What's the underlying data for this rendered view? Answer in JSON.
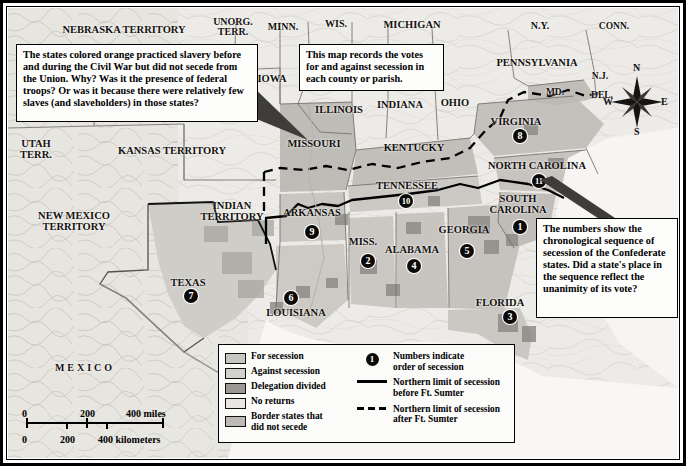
{
  "map": {
    "title_hidden": "Secession of the Southern States",
    "state_labels": [
      {
        "text": "NEBRASKA TERRITORY",
        "x": 124,
        "y": 30,
        "size": 10.5,
        "spaced": false
      },
      {
        "text": "UNORG.\nTERR.",
        "x": 233,
        "y": 27,
        "size": 10,
        "spaced": false
      },
      {
        "text": "MINN.",
        "x": 283,
        "y": 27,
        "size": 10,
        "spaced": false
      },
      {
        "text": "WIS.",
        "x": 336,
        "y": 24,
        "size": 10,
        "spaced": false
      },
      {
        "text": "MICHIGAN",
        "x": 412,
        "y": 25,
        "size": 10.5,
        "spaced": false
      },
      {
        "text": "N.Y.",
        "x": 540,
        "y": 26,
        "size": 10,
        "spaced": false
      },
      {
        "text": "CONN.",
        "x": 614,
        "y": 27,
        "size": 9.5,
        "spaced": false
      },
      {
        "text": "IOWA",
        "x": 272,
        "y": 79,
        "size": 10.5,
        "spaced": false
      },
      {
        "text": "ILLINOIS",
        "x": 339,
        "y": 110,
        "size": 10.5,
        "spaced": false
      },
      {
        "text": "INDIANA",
        "x": 400,
        "y": 105,
        "size": 10.5,
        "spaced": false
      },
      {
        "text": "OHIO",
        "x": 455,
        "y": 103,
        "size": 10.5,
        "spaced": false
      },
      {
        "text": "PENNSYLVANIA",
        "x": 537,
        "y": 63,
        "size": 10.5,
        "spaced": false
      },
      {
        "text": "N.J.",
        "x": 600,
        "y": 77,
        "size": 9.5,
        "spaced": false
      },
      {
        "text": "MD.",
        "x": 555,
        "y": 93,
        "size": 9.5,
        "spaced": false
      },
      {
        "text": "DEL.",
        "x": 602,
        "y": 96,
        "size": 9.5,
        "spaced": false
      },
      {
        "text": "UTAH\nTERR.",
        "x": 36,
        "y": 150,
        "size": 10.5,
        "spaced": false
      },
      {
        "text": "KANSAS TERRITORY",
        "x": 172,
        "y": 151,
        "size": 10.5,
        "spaced": false
      },
      {
        "text": "MISSOURI",
        "x": 314,
        "y": 144,
        "size": 10.5,
        "spaced": false
      },
      {
        "text": "KENTUCKY",
        "x": 414,
        "y": 148,
        "size": 10.5,
        "spaced": false
      },
      {
        "text": "VIRGINIA",
        "x": 516,
        "y": 122,
        "size": 10.5,
        "spaced": false
      },
      {
        "text": "NORTH CAROLINA",
        "x": 537,
        "y": 166,
        "size": 10.5,
        "spaced": false
      },
      {
        "text": "NEW MEXICO\nTERRITORY",
        "x": 74,
        "y": 222,
        "size": 10.5,
        "spaced": false
      },
      {
        "text": "INDIAN\nTERRITORY",
        "x": 232,
        "y": 212,
        "size": 10.5,
        "spaced": false
      },
      {
        "text": "ARKANSAS",
        "x": 312,
        "y": 213,
        "size": 10.5,
        "spaced": false
      },
      {
        "text": "TENNESSEE",
        "x": 407,
        "y": 186,
        "size": 10.5,
        "spaced": false
      },
      {
        "text": "SOUTH\nCAROLINA",
        "x": 518,
        "y": 205,
        "size": 10.5,
        "spaced": false
      },
      {
        "text": "MISS.",
        "x": 363,
        "y": 242,
        "size": 10.5,
        "spaced": false
      },
      {
        "text": "ALABAMA",
        "x": 412,
        "y": 250,
        "size": 10.5,
        "spaced": false
      },
      {
        "text": "GEORGIA",
        "x": 464,
        "y": 230,
        "size": 10.5,
        "spaced": false
      },
      {
        "text": "TEXAS",
        "x": 188,
        "y": 283,
        "size": 10.5,
        "spaced": false
      },
      {
        "text": "LOUISIANA",
        "x": 296,
        "y": 313,
        "size": 10.5,
        "spaced": false
      },
      {
        "text": "FLORIDA",
        "x": 500,
        "y": 303,
        "size": 10.5,
        "spaced": false
      },
      {
        "text": "MEXICO",
        "x": 85,
        "y": 368,
        "size": 10,
        "spaced": true
      }
    ],
    "secession_badges": [
      {
        "number": "1",
        "state": "South Carolina",
        "x": 520,
        "y": 227
      },
      {
        "number": "2",
        "state": "Mississippi",
        "x": 368,
        "y": 261
      },
      {
        "number": "3",
        "state": "Florida",
        "x": 510,
        "y": 317
      },
      {
        "number": "4",
        "state": "Alabama",
        "x": 414,
        "y": 266
      },
      {
        "number": "5",
        "state": "Georgia",
        "x": 467,
        "y": 251
      },
      {
        "number": "6",
        "state": "Louisiana",
        "x": 291,
        "y": 298
      },
      {
        "number": "7",
        "state": "Texas",
        "x": 191,
        "y": 296
      },
      {
        "number": "8",
        "state": "Virginia",
        "x": 520,
        "y": 136
      },
      {
        "number": "9",
        "state": "Arkansas",
        "x": 312,
        "y": 232
      },
      {
        "number": "10",
        "state": "Tennessee",
        "x": 406,
        "y": 201
      },
      {
        "number": "11",
        "state": "North Carolina",
        "x": 539,
        "y": 181
      }
    ]
  },
  "callouts": [
    {
      "id": "orange-states-note",
      "text": "The states colored orange practiced slavery before and during the Civil War but did not secede from the Union. Why? Was it the presence of federal troops? Or was it because there were relatively few slaves (and slaveholders) in those states?",
      "x": 16,
      "y": 44,
      "w": 242,
      "h": 78,
      "font": 10.2
    },
    {
      "id": "votes-note",
      "text": "This map records the votes for and against secession in each county or parish.",
      "x": 299,
      "y": 44,
      "w": 145,
      "h": 42,
      "font": 10.2
    },
    {
      "id": "numbers-note",
      "text": "The numbers show the chronological sequence of secession of the Confederate states. Did a state's place in the sequence reflect the unanimity of its vote?",
      "x": 536,
      "y": 218,
      "w": 142,
      "h": 100,
      "font": 10.2
    }
  ],
  "legend": {
    "swatches": [
      {
        "label": "For secession",
        "color": "#c8c6c1"
      },
      {
        "label": "Against secession",
        "color": "#d2d0cb"
      },
      {
        "label": "Delegation divided",
        "color": "#9b9893"
      },
      {
        "label": "No returns",
        "color": "#e9e7e3"
      },
      {
        "label": "Border states that\ndid not secede",
        "color": "#bdbab5"
      }
    ],
    "keys": [
      {
        "icon": "badge",
        "symbol": "1",
        "label": "Numbers indicate\norder of secession"
      },
      {
        "icon": "solid-line",
        "symbol": "",
        "label": "Northern limit of secession\nbefore Ft. Sumter"
      },
      {
        "icon": "dashed-line",
        "symbol": "",
        "label": "Northern limit of secession\nafter Ft. Sumter"
      }
    ]
  },
  "scalebar": {
    "miles_labels": [
      "0",
      "200",
      "400 miles"
    ],
    "km_labels": [
      "0",
      "200",
      "400 kilometers"
    ]
  },
  "compass": {
    "north": "N",
    "east": "E",
    "south": "S",
    "west": "W"
  },
  "colors": {
    "frame": "#000000",
    "land_base": "#e8e6e1",
    "for_secession": "#c8c6c1",
    "against_secession": "#d2d0cb",
    "delegation_divided": "#9b9893",
    "no_returns": "#e9e7e3",
    "border_states": "#bdbab5",
    "water": "#f7f6f4",
    "label_text": "#14110e"
  }
}
